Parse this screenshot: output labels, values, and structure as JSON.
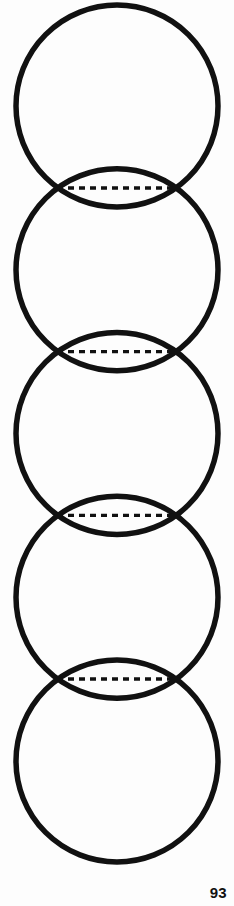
{
  "page": {
    "number": "93",
    "background_color": "#fdfdfd",
    "ink_color": "#111111",
    "width": 234,
    "height": 906
  },
  "figure": {
    "name": "vertical-chain-of-five-circles",
    "stroke_color": "#111111",
    "stroke_width": 5.5,
    "fill_color": "none",
    "circle_count": 5,
    "center_x": 117,
    "radius": 101,
    "circles": [
      {
        "label": "circle-1",
        "cx": 117,
        "cy": 106,
        "r": 101
      },
      {
        "label": "circle-2",
        "cx": 117,
        "cy": 269.75,
        "r": 101
      },
      {
        "label": "circle-3",
        "cx": 117,
        "cy": 433.5,
        "r": 101
      },
      {
        "label": "circle-4",
        "cx": 117,
        "cy": 597.25,
        "r": 101
      },
      {
        "label": "circle-5",
        "cx": 117,
        "cy": 761,
        "r": 101
      }
    ],
    "dashed_connectors": [
      {
        "label": "dashed-line-1",
        "y": 188,
        "x1": 57,
        "x2": 177
      },
      {
        "label": "dashed-line-2",
        "y": 351.6,
        "x1": 57,
        "x2": 177
      },
      {
        "label": "dashed-line-3",
        "y": 515.4,
        "x1": 57,
        "x2": 177
      },
      {
        "label": "dashed-line-4",
        "y": 679,
        "x1": 57,
        "x2": 177
      }
    ],
    "dash_pattern": "6 5"
  }
}
